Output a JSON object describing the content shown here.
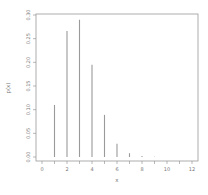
{
  "chart_data": {
    "type": "bar",
    "style": "spike",
    "title": "",
    "xlabel": "x",
    "ylabel": "p(x)",
    "x": [
      1,
      2,
      3,
      4,
      5,
      6,
      7,
      8,
      9
    ],
    "values": [
      0.11,
      0.266,
      0.29,
      0.195,
      0.089,
      0.028,
      0.008,
      0.002,
      0.0005
    ],
    "xlim": [
      -0.6,
      12.6
    ],
    "ylim": [
      0.0,
      0.3
    ],
    "xticks": [
      0,
      2,
      4,
      6,
      8,
      10,
      12
    ],
    "yticks": [
      0.0,
      0.05,
      0.1,
      0.15,
      0.2,
      0.25,
      0.3
    ],
    "ytick_labels": [
      "0.00",
      "0.05",
      "0.10",
      "0.15",
      "0.20",
      "0.25",
      "0.30"
    ],
    "grid": false,
    "legend": null,
    "colors": {
      "bar": "#9a9a9a",
      "axis": "#8a8a8a"
    }
  }
}
